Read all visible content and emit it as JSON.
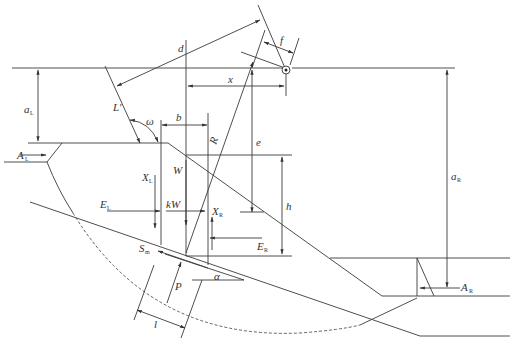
{
  "diagram": {
    "type": "slope-stability-force-diagram",
    "colors": {
      "line": "#3a3a3a",
      "background": "#ffffff",
      "text": "#333333"
    },
    "labels": {
      "aL": {
        "main": "a",
        "sub": "L"
      },
      "AL": {
        "main": "A",
        "sub": "L"
      },
      "L_prime": {
        "main": "L′"
      },
      "omega": {
        "main": "ω"
      },
      "b": {
        "main": "b"
      },
      "d": {
        "main": "d"
      },
      "x": {
        "main": "x"
      },
      "f": {
        "main": "f"
      },
      "R": {
        "main": "R"
      },
      "e": {
        "main": "e"
      },
      "h": {
        "main": "h"
      },
      "W": {
        "main": "W"
      },
      "XL": {
        "main": "X",
        "sub": "L"
      },
      "EL": {
        "main": "E",
        "sub": "L"
      },
      "kW": {
        "main": "kW"
      },
      "XR": {
        "main": "X",
        "sub": "R"
      },
      "ER": {
        "main": "E",
        "sub": "R"
      },
      "Sm": {
        "main": "S",
        "sub": "m"
      },
      "P": {
        "main": "P"
      },
      "alpha": {
        "main": "α"
      },
      "l": {
        "main": "l"
      },
      "aR": {
        "main": "a",
        "sub": "R"
      },
      "AR": {
        "main": "A",
        "sub": "R"
      }
    },
    "elements": [
      "ground-surface-line",
      "slope-crest",
      "slope-face",
      "slope-toe",
      "failure-arc",
      "slice-boundaries",
      "rotation-center",
      "weight-vector",
      "seismic-force-vector",
      "interslice-forces",
      "normal-force",
      "shear-force"
    ]
  }
}
